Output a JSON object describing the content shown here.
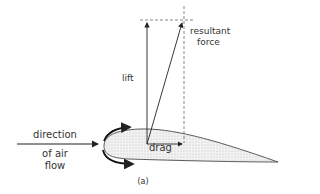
{
  "diagram": {
    "type": "airfoil-force-diagram",
    "labels": {
      "resultant_line1": "resultant",
      "resultant_line2": "force",
      "lift": "lift",
      "drag": "drag",
      "direction_line1": "direction",
      "direction_line2": "of air",
      "direction_line3": "flow",
      "caption": "(a)"
    },
    "colors": {
      "line": "#222222",
      "airfoil_fill": "#e6e6e6",
      "dashed": "#555555"
    }
  }
}
